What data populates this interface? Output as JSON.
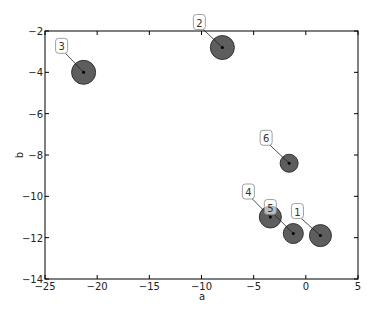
{
  "chart_data": {
    "type": "scatter",
    "title": "",
    "xlabel": "a",
    "ylabel": "b",
    "xlim": [
      -25,
      5
    ],
    "ylim": [
      -14,
      -2
    ],
    "xticks": [
      -25,
      -20,
      -15,
      -10,
      -5,
      0,
      5
    ],
    "yticks": [
      -2,
      -4,
      -6,
      -8,
      -10,
      -12,
      -14
    ],
    "grid": false,
    "legend": null,
    "marker_color": "#4d4d4d",
    "marker_edge_color": "#333333",
    "points": [
      {
        "label": "1",
        "x": 1.4,
        "y": -11.9,
        "size": 11,
        "label_dx": -23,
        "label_dy": -24
      },
      {
        "label": "2",
        "x": -8.0,
        "y": -2.8,
        "size": 12,
        "label_dx": -23,
        "label_dy": -25
      },
      {
        "label": "3",
        "x": -21.3,
        "y": -4.0,
        "size": 12,
        "label_dx": -22,
        "label_dy": -26
      },
      {
        "label": "4",
        "x": -3.4,
        "y": -11.0,
        "size": 11,
        "label_dx": -22,
        "label_dy": -25
      },
      {
        "label": "5",
        "x": -1.2,
        "y": -11.8,
        "size": 10,
        "label_dx": -23,
        "label_dy": -26
      },
      {
        "label": "6",
        "x": -1.6,
        "y": -8.4,
        "size": 9,
        "label_dx": -23,
        "label_dy": -25
      }
    ]
  },
  "axes": {
    "xlabel": "a",
    "ylabel": "b",
    "xtick_labels": [
      "−25",
      "−20",
      "−15",
      "−10",
      "−5",
      "0",
      "5"
    ],
    "ytick_labels": [
      "−2",
      "−4",
      "−6",
      "−8",
      "−10",
      "−12",
      "−14"
    ]
  }
}
